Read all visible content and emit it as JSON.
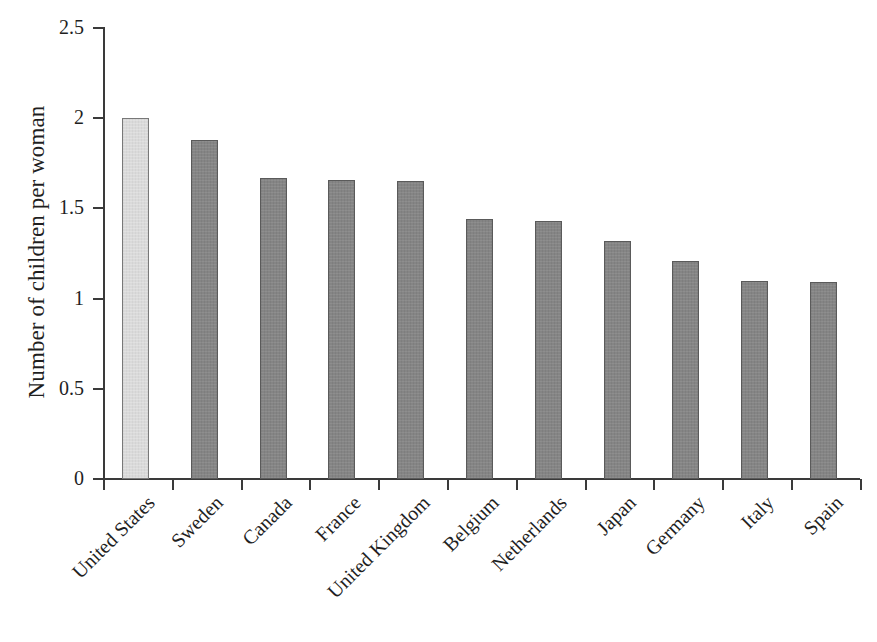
{
  "chart_data": {
    "type": "bar",
    "title": "",
    "xlabel": "",
    "ylabel": "Number of children per woman",
    "ylim": [
      0,
      2.5
    ],
    "ytick_labels": [
      "0",
      "0.5",
      "1",
      "1.5",
      "2",
      "2.5"
    ],
    "ytick_values": [
      0,
      0.5,
      1,
      1.5,
      2,
      2.5
    ],
    "grid": false,
    "legend": "none",
    "categories": [
      "United States",
      "Sweden",
      "Canada",
      "France",
      "United Kingdom",
      "Belgium",
      "Netherlands",
      "Japan",
      "Germany",
      "Italy",
      "Spain"
    ],
    "values": [
      2.0,
      1.88,
      1.67,
      1.66,
      1.65,
      1.44,
      1.43,
      1.32,
      1.21,
      1.1,
      1.09
    ],
    "bar_colors": [
      "#dadada",
      "#858585",
      "#858585",
      "#858585",
      "#858585",
      "#858585",
      "#858585",
      "#858585",
      "#858585",
      "#858585",
      "#858585"
    ],
    "highlight_category": "United States",
    "highlight_color": "#dadada",
    "series_color": "#858585",
    "axis_color": "#3a3a3a"
  }
}
